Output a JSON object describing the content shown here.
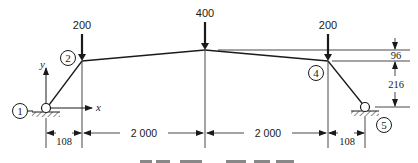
{
  "diagram": {
    "type": "truss-frame-structure",
    "nodes": [
      {
        "id": "1",
        "label": "1",
        "support": "pin"
      },
      {
        "id": "2",
        "label": "2"
      },
      {
        "id": "3",
        "label": ""
      },
      {
        "id": "4",
        "label": "4"
      },
      {
        "id": "5",
        "label": "5",
        "support": "pin"
      }
    ],
    "loads": [
      {
        "node": "2",
        "value": "200"
      },
      {
        "node": "3",
        "value": "400"
      },
      {
        "node": "4",
        "value": "200"
      }
    ],
    "axes": {
      "x_label": "x",
      "y_label": "y"
    },
    "horizontal_dimensions": [
      "108",
      "2 000",
      "2 000",
      "108"
    ],
    "vertical_dimensions": [
      "96",
      "216"
    ],
    "caption_partial": ""
  },
  "colors": {
    "ink": "#1a1a1a",
    "background": "#ffffff"
  }
}
